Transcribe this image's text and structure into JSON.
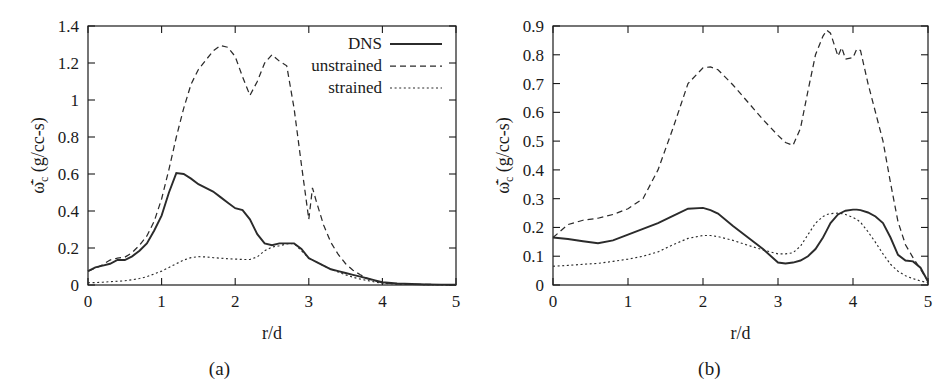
{
  "figure": {
    "panels": [
      {
        "id": "a",
        "caption": "(a)",
        "xlabel": "r/d",
        "ylabel_parts": {
          "symbol": "ω",
          "subscript": "c",
          "units": "(g/cc-s)"
        },
        "legend_position": "top-right",
        "legend": [
          {
            "label": "DNS",
            "style": "solid"
          },
          {
            "label": "unstrained",
            "style": "dashed"
          },
          {
            "label": "strained",
            "style": "dotted"
          }
        ]
      },
      {
        "id": "b",
        "caption": "(b)",
        "xlabel": "r/d",
        "ylabel_parts": {
          "symbol": "ω",
          "subscript": "c",
          "units": "(g/cc-s)"
        },
        "legend_position": "none",
        "legend": []
      }
    ]
  },
  "chart_data": [
    {
      "type": "line",
      "panel": "a",
      "title": "(a)",
      "xlabel": "r/d",
      "ylabel": "ω̇̄_c (g/cc-s)",
      "xlim": [
        0,
        5
      ],
      "ylim": [
        0,
        1.4
      ],
      "xticks": [
        "0",
        "1",
        "2",
        "3",
        "4",
        "5"
      ],
      "yticks": [
        "0",
        "0.2",
        "0.4",
        "0.6",
        "0.8",
        "1",
        "1.2",
        "1.4"
      ],
      "grid": false,
      "legend": [
        "DNS",
        "unstrained",
        "strained"
      ],
      "legend_position": "top-right",
      "x": [
        0.0,
        0.1,
        0.2,
        0.3,
        0.4,
        0.5,
        0.6,
        0.7,
        0.8,
        0.9,
        1.0,
        1.1,
        1.2,
        1.3,
        1.4,
        1.5,
        1.6,
        1.7,
        1.8,
        1.9,
        2.0,
        2.1,
        2.2,
        2.3,
        2.4,
        2.5,
        2.6,
        2.7,
        2.8,
        2.9,
        3.0,
        3.05,
        3.1,
        3.2,
        3.3,
        3.4,
        3.5,
        3.6,
        3.7,
        3.8,
        3.9,
        4.0,
        4.2,
        4.4,
        4.6,
        4.8,
        5.0
      ],
      "series": [
        {
          "name": "DNS",
          "style": "solid",
          "values": [
            0.075,
            0.095,
            0.105,
            0.115,
            0.135,
            0.135,
            0.155,
            0.185,
            0.225,
            0.295,
            0.375,
            0.5,
            0.605,
            0.6,
            0.575,
            0.545,
            0.525,
            0.505,
            0.475,
            0.445,
            0.415,
            0.405,
            0.355,
            0.275,
            0.225,
            0.215,
            0.225,
            0.225,
            0.225,
            0.195,
            0.145,
            0.135,
            0.125,
            0.105,
            0.085,
            0.075,
            0.065,
            0.055,
            0.045,
            0.035,
            0.025,
            0.015,
            0.008,
            0.005,
            0.003,
            0.002,
            0.001
          ]
        },
        {
          "name": "unstrained",
          "style": "dashed",
          "values": [
            0.075,
            0.09,
            0.11,
            0.135,
            0.145,
            0.15,
            0.175,
            0.215,
            0.265,
            0.345,
            0.465,
            0.625,
            0.8,
            0.955,
            1.085,
            1.165,
            1.215,
            1.265,
            1.295,
            1.285,
            1.235,
            1.125,
            1.025,
            1.1,
            1.2,
            1.245,
            1.21,
            1.185,
            0.955,
            0.65,
            0.355,
            0.525,
            0.455,
            0.325,
            0.23,
            0.165,
            0.115,
            0.08,
            0.055,
            0.035,
            0.022,
            0.012,
            0.006,
            0.004,
            0.003,
            0.002,
            0.001
          ]
        },
        {
          "name": "strained",
          "style": "dotted",
          "values": [
            0.012,
            0.013,
            0.015,
            0.018,
            0.02,
            0.023,
            0.028,
            0.035,
            0.045,
            0.06,
            0.075,
            0.095,
            0.115,
            0.135,
            0.148,
            0.153,
            0.152,
            0.148,
            0.145,
            0.142,
            0.14,
            0.138,
            0.138,
            0.152,
            0.185,
            0.205,
            0.212,
            0.222,
            0.225,
            0.185,
            0.145,
            0.135,
            0.125,
            0.105,
            0.085,
            0.07,
            0.055,
            0.042,
            0.032,
            0.024,
            0.016,
            0.009,
            0.005,
            0.003,
            0.002,
            0.001,
            0.001
          ]
        }
      ]
    },
    {
      "type": "line",
      "panel": "b",
      "title": "(b)",
      "xlabel": "r/d",
      "ylabel": "ω̇̄_c (g/cc-s)",
      "xlim": [
        0,
        5
      ],
      "ylim": [
        0,
        0.9
      ],
      "xticks": [
        "0",
        "1",
        "2",
        "3",
        "4",
        "5"
      ],
      "yticks": [
        "0",
        "0.1",
        "0.2",
        "0.3",
        "0.4",
        "0.5",
        "0.6",
        "0.7",
        "0.8",
        "0.9"
      ],
      "grid": false,
      "legend": [],
      "legend_position": "none",
      "x": [
        0.0,
        0.2,
        0.4,
        0.6,
        0.8,
        1.0,
        1.2,
        1.4,
        1.6,
        1.8,
        2.0,
        2.1,
        2.2,
        2.4,
        2.6,
        2.8,
        3.0,
        3.1,
        3.2,
        3.3,
        3.4,
        3.5,
        3.6,
        3.65,
        3.7,
        3.8,
        3.85,
        3.9,
        4.0,
        4.05,
        4.1,
        4.2,
        4.3,
        4.4,
        4.5,
        4.6,
        4.7,
        4.8,
        4.9,
        5.0
      ],
      "series": [
        {
          "name": "DNS",
          "style": "solid",
          "values": [
            0.165,
            0.16,
            0.152,
            0.145,
            0.155,
            0.175,
            0.195,
            0.215,
            0.24,
            0.265,
            0.268,
            0.26,
            0.248,
            0.205,
            0.165,
            0.125,
            0.078,
            0.075,
            0.078,
            0.085,
            0.1,
            0.125,
            0.165,
            0.19,
            0.215,
            0.245,
            0.252,
            0.258,
            0.262,
            0.262,
            0.26,
            0.252,
            0.238,
            0.215,
            0.165,
            0.105,
            0.085,
            0.082,
            0.06,
            0.012
          ]
        },
        {
          "name": "unstrained",
          "style": "dashed",
          "values": [
            0.165,
            0.21,
            0.225,
            0.232,
            0.245,
            0.265,
            0.3,
            0.4,
            0.545,
            0.7,
            0.755,
            0.758,
            0.748,
            0.695,
            0.635,
            0.575,
            0.52,
            0.495,
            0.485,
            0.545,
            0.675,
            0.8,
            0.865,
            0.885,
            0.875,
            0.795,
            0.825,
            0.785,
            0.79,
            0.82,
            0.815,
            0.7,
            0.6,
            0.5,
            0.355,
            0.22,
            0.14,
            0.095,
            0.055,
            0.012
          ]
        },
        {
          "name": "strained",
          "style": "dotted",
          "values": [
            0.065,
            0.068,
            0.072,
            0.075,
            0.082,
            0.09,
            0.1,
            0.115,
            0.14,
            0.162,
            0.172,
            0.172,
            0.168,
            0.155,
            0.138,
            0.122,
            0.108,
            0.108,
            0.112,
            0.135,
            0.175,
            0.215,
            0.238,
            0.245,
            0.248,
            0.25,
            0.248,
            0.245,
            0.235,
            0.228,
            0.218,
            0.185,
            0.148,
            0.108,
            0.072,
            0.048,
            0.032,
            0.022,
            0.014,
            0.008
          ]
        }
      ]
    }
  ]
}
